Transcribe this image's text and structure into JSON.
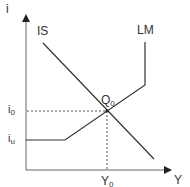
{
  "diagram": {
    "axes": {
      "y_label": "i",
      "x_label": "Y"
    },
    "curves": {
      "is_label": "IS",
      "lm_label": "LM"
    },
    "equilibrium": {
      "point_label": "Q",
      "point_sub": "0",
      "interest_label": "i",
      "interest_sub": "0",
      "output_label": "Y",
      "output_sub": "0"
    },
    "lower_bound": {
      "label": "i",
      "sub": "u"
    },
    "colors": {
      "line": "#333333",
      "dotted": "#555555"
    }
  }
}
